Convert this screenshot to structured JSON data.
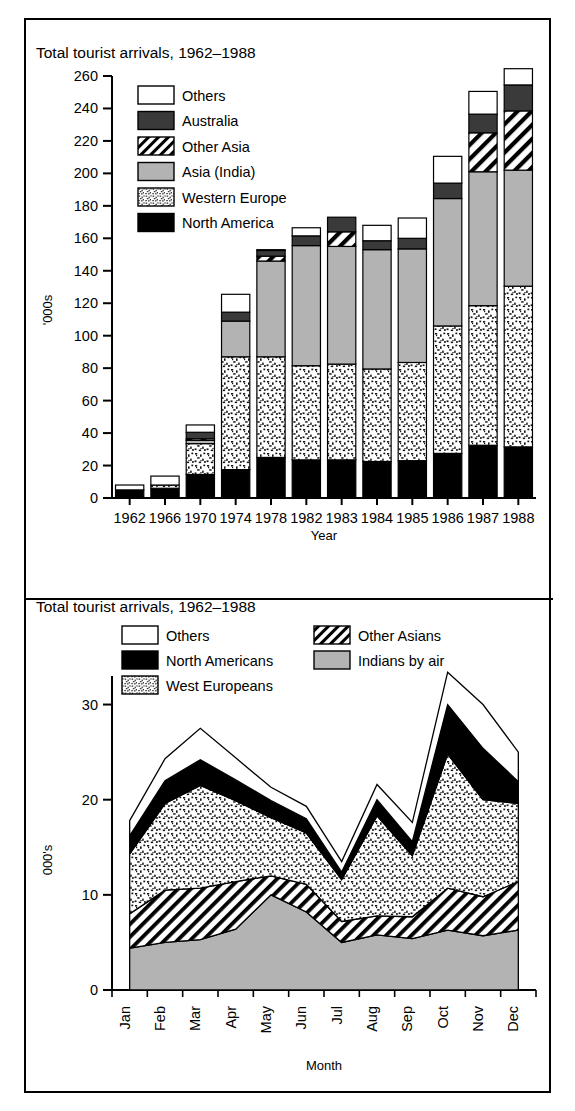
{
  "figure": {
    "outer_border_color": "#000000",
    "background": "#ffffff"
  },
  "top_chart": {
    "title": "Total tourist arrivals, 1962–1988",
    "ylabel": "'000s",
    "xlabel": "Year",
    "legend": [
      {
        "key": "others",
        "label": "Others",
        "fill": "#ffffff",
        "pattern": "solid"
      },
      {
        "key": "australia",
        "label": "Australia",
        "fill": "#3a3a3a",
        "pattern": "solid"
      },
      {
        "key": "other_asia",
        "label": "Other Asia",
        "fill": "#ffffff",
        "pattern": "diagonal"
      },
      {
        "key": "asia_india",
        "label": "Asia (India)",
        "fill": "#b3b3b3",
        "pattern": "solid"
      },
      {
        "key": "western_europe",
        "label": "Western Europe",
        "fill": "#ffffff",
        "pattern": "speckle"
      },
      {
        "key": "north_america",
        "label": "North America",
        "fill": "#000000",
        "pattern": "solid"
      }
    ]
  },
  "bottom_chart": {
    "title": "Total tourist arrivals, 1962–1988",
    "ylabel": "000's",
    "xlabel": "Month",
    "legend": [
      {
        "key": "others",
        "label": "Others",
        "fill": "#ffffff",
        "pattern": "solid",
        "col": 0,
        "row": 0
      },
      {
        "key": "other_asians",
        "label": "Other Asians",
        "fill": "#ffffff",
        "pattern": "diagonal",
        "col": 1,
        "row": 0
      },
      {
        "key": "north_america",
        "label": "North Americans",
        "fill": "#000000",
        "pattern": "solid",
        "col": 0,
        "row": 1
      },
      {
        "key": "indians_by_air",
        "label": "Indians by air",
        "fill": "#b3b3b3",
        "pattern": "solid",
        "col": 1,
        "row": 1
      },
      {
        "key": "west_europeans",
        "label": "West Europeans",
        "fill": "#ffffff",
        "pattern": "speckle",
        "col": 0,
        "row": 2
      }
    ]
  },
  "chart_data": [
    {
      "type": "bar",
      "stacked": true,
      "title": "Total tourist arrivals, 1962–1988",
      "xlabel": "Year",
      "ylabel": "'000s",
      "ylim": [
        0,
        260
      ],
      "yticks": [
        0,
        20,
        40,
        60,
        80,
        100,
        120,
        140,
        160,
        180,
        200,
        220,
        240,
        260
      ],
      "grid": false,
      "legend_position": "upper-left inside",
      "categories": [
        "1962",
        "1966",
        "1970",
        "1974",
        "1978",
        "1982",
        "1983",
        "1984",
        "1985",
        "1986",
        "1987",
        "1988"
      ],
      "series": [
        {
          "name": "North America",
          "values": [
            5.0,
            6.0,
            14.5,
            17.5,
            25.0,
            23.5,
            23.5,
            22.5,
            23.0,
            27.5,
            32.5,
            31.5
          ]
        },
        {
          "name": "Western Europe",
          "values": [
            0.0,
            2.0,
            19.0,
            69.5,
            62.0,
            58.0,
            59.0,
            57.0,
            60.5,
            78.5,
            86.0,
            99.0
          ]
        },
        {
          "name": "Asia (India)",
          "values": [
            0.0,
            0.0,
            2.0,
            22.0,
            59.0,
            74.0,
            72.5,
            73.5,
            70.0,
            78.5,
            82.5,
            71.5
          ]
        },
        {
          "name": "Other Asia",
          "values": [
            0.0,
            0.0,
            1.0,
            0.0,
            3.0,
            0.0,
            9.0,
            0.0,
            0.0,
            0.0,
            24.0,
            36.5
          ]
        },
        {
          "name": "Australia",
          "values": [
            0.0,
            0.0,
            4.0,
            5.5,
            3.5,
            6.0,
            9.0,
            5.5,
            6.5,
            9.5,
            11.5,
            16.0
          ]
        },
        {
          "name": "Others",
          "values": [
            3.0,
            5.5,
            4.5,
            11.0,
            0.5,
            5.0,
            0.0,
            9.5,
            12.5,
            16.5,
            14.0,
            10.0
          ]
        }
      ],
      "totals": [
        8.0,
        13.5,
        45.0,
        125.5,
        153.0,
        166.5,
        173.0,
        168.0,
        172.5,
        210.5,
        250.5,
        264.5
      ]
    },
    {
      "type": "area",
      "stacked": true,
      "title": "Total tourist arrivals, 1962–1988",
      "xlabel": "Month",
      "ylabel": "000's",
      "ylim": [
        0,
        33
      ],
      "yticks": [
        0,
        10,
        20,
        30
      ],
      "grid": false,
      "legend_position": "upper-left inside (two columns)",
      "categories": [
        "Jan",
        "Feb",
        "Mar",
        "Apr",
        "May",
        "Jun",
        "Jul",
        "Aug",
        "Sep",
        "Oct",
        "Nov",
        "Dec"
      ],
      "series": [
        {
          "name": "Indians by air",
          "values": [
            4.4,
            5.0,
            5.3,
            6.4,
            10.0,
            8.2,
            5.0,
            5.8,
            5.4,
            6.3,
            5.7,
            6.3
          ]
        },
        {
          "name": "Other Asians",
          "values": [
            3.6,
            5.5,
            5.4,
            5.0,
            2.0,
            2.9,
            2.2,
            2.0,
            2.3,
            4.4,
            4.1,
            5.1
          ]
        },
        {
          "name": "West Europeans",
          "values": [
            6.3,
            9.1,
            10.8,
            8.5,
            6.1,
            5.4,
            4.4,
            10.5,
            6.4,
            14.1,
            10.2,
            8.2
          ]
        },
        {
          "name": "North Americans",
          "values": [
            1.9,
            2.4,
            2.7,
            2.2,
            1.8,
            1.5,
            0.8,
            1.7,
            1.5,
            5.2,
            5.4,
            2.3
          ]
        },
        {
          "name": "Others",
          "values": [
            1.6,
            2.3,
            3.3,
            2.3,
            1.4,
            1.3,
            1.1,
            1.6,
            2.0,
            3.4,
            4.6,
            3.1
          ]
        }
      ],
      "totals": [
        17.8,
        24.3,
        27.5,
        24.4,
        21.3,
        19.3,
        13.5,
        21.6,
        17.6,
        33.4,
        30.0,
        25.0
      ]
    }
  ]
}
